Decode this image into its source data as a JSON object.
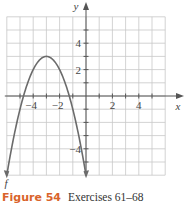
{
  "chart_data": {
    "type": "line",
    "title": "",
    "xlabel": "x",
    "ylabel": "y",
    "xlim": [
      -6,
      6
    ],
    "ylim": [
      -6,
      6
    ],
    "grid": true,
    "x_tick_labels": [
      "-4",
      "-2",
      "2",
      "4"
    ],
    "y_tick_labels": [
      "4",
      "2",
      "-4"
    ],
    "series": [
      {
        "name": "f",
        "function": "-(x+3)^2+3",
        "x": [
          -6,
          -5.5,
          -5,
          -4.5,
          -4,
          -3.5,
          -3,
          -2.5,
          -2,
          -1.5,
          -1,
          -0.5,
          0
        ],
        "y": [
          -6,
          -3.25,
          -1,
          0.75,
          2,
          2.75,
          3,
          2.75,
          2,
          0.75,
          -1,
          -3.25,
          -6
        ],
        "vertex": [
          -3,
          3
        ],
        "arrows_at_ends": true
      }
    ],
    "curve_label": "f"
  },
  "colors": {
    "grid": "#c8c8c8",
    "axis": "#555555",
    "curve": "#6b6b6b",
    "caption_label": "#d9632b"
  },
  "caption": {
    "label": "Figure 54",
    "text": "Exercises 61–68"
  }
}
